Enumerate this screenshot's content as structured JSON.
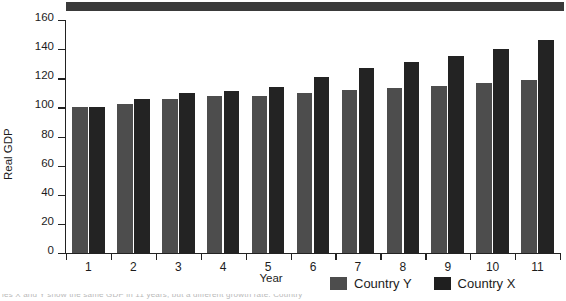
{
  "chart_data": {
    "type": "bar",
    "title": "",
    "xlabel": "Year",
    "ylabel": "Real GDP",
    "categories": [
      "1",
      "2",
      "3",
      "4",
      "5",
      "6",
      "7",
      "8",
      "9",
      "10",
      "11"
    ],
    "series": [
      {
        "name": "Country Y",
        "color": "#4d4d4d",
        "values": [
          100,
          102,
          106,
          108,
          108,
          110,
          112,
          113,
          115,
          117,
          119
        ]
      },
      {
        "name": "Country X",
        "color": "#232323",
        "values": [
          100,
          106,
          110,
          111,
          114,
          121,
          127,
          131,
          135,
          140,
          146
        ]
      }
    ],
    "ylim": [
      0,
      160
    ],
    "yticks": [
      0,
      20,
      40,
      60,
      80,
      100,
      120,
      140,
      160
    ],
    "grid": false,
    "legend_position": "bottom-right"
  },
  "legend": {
    "items": [
      {
        "label": "Country Y",
        "swatch": "legend-swatch-country-y"
      },
      {
        "label": "Country X",
        "swatch": "legend-swatch-country-x"
      }
    ]
  },
  "caption": {
    "text": "ies X and Y show the same GDP in 11 years, but a different growth rate. Country"
  }
}
